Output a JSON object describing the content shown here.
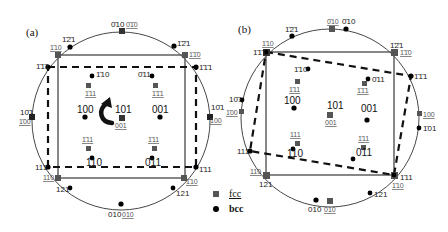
{
  "figure": {
    "panels": [
      {
        "id": "a",
        "tag": "(a)",
        "labels": {
          "top_bcc": "0̄10",
          "top_fcc": "0̄1̄0",
          "ul_121": "1̄2̄1",
          "ur_121": "1̄2̄1",
          "ul_fcc_110": "1̄10",
          "ur_fcc_110": "1̄1̄0",
          "ul_111": "1̄1̄1",
          "ur_111": "1̄1̄1",
          "in_110": "1̄10",
          "in_011": "0̄11",
          "in_fcc_111a": "1̄11",
          "in_fcc_111b": "1̄1̄1",
          "c100": "100",
          "c101": "101",
          "c001": "001",
          "c001_fcc": "001",
          "l101": "10̄1",
          "l100": "1̄00",
          "r101": "10̄1",
          "r100": "100",
          "lo_fcc_111a": "1̄11",
          "lo_fcc_111b": "1̄11",
          "lo_110": "110",
          "lo_011": "0̄11",
          "bl_111": "111",
          "br_111": "1̄11",
          "bl_fcc_110": "110",
          "br_fcc_110": "1̄10",
          "bl_121": "121",
          "br_121": "121",
          "bot_bcc": "010",
          "bot_fcc": "010"
        }
      },
      {
        "id": "b",
        "tag": "(b)",
        "labels": {
          "top_fcc": "0̄10",
          "top_bcc": "0̄10",
          "ul_121": "1̄2̄1",
          "ur_121": "1̄2̄1",
          "ul_fcc_110": "1̄10",
          "ur_fcc_110": "1̄1̄0",
          "ul_111": "1̄1̄1",
          "r_111": "1̄1̄1",
          "in_110": "1̄10",
          "in_011": "0̄11",
          "in_fcc_111a": "1̄11",
          "in_fcc_111b": "1̄1̄1",
          "c100": "100",
          "c101": "101",
          "c001": "001",
          "c001_fcc": "001",
          "l101": "10̄1",
          "l100": "1̄00",
          "r100": "100",
          "r101": "1̄01",
          "lo_fcc_111a": "111",
          "lo_fcc_111b": "1̄11",
          "lo_110": "110",
          "lo_011": "011",
          "l_111": "111",
          "br_111": "1̄11",
          "bl_fcc_110": "110",
          "br_fcc_110": "1̄10",
          "bl_121": "121",
          "br_121": "121",
          "bot_bcc": "010",
          "bot_fcc": "010"
        }
      }
    ],
    "legend": {
      "fcc_label": "fcc",
      "bcc_label": "bcc"
    },
    "colors": {
      "fcc_marker": "#555555",
      "bcc_marker": "#000000",
      "circle": "#333333",
      "solid_square": "#555555",
      "dashed_square": "#111111"
    }
  }
}
